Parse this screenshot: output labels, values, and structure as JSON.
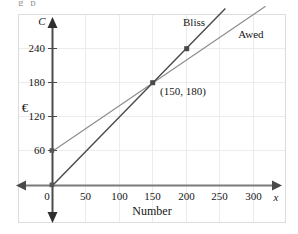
{
  "figure": {
    "clipped_top_text": "g   p",
    "frame_color": "#dcdcdc",
    "background": "#ffffff"
  },
  "chart_data": {
    "type": "line",
    "title": "",
    "subtitle": "",
    "xlabel": "Number",
    "ylabel": "€",
    "x_axis_name": "x",
    "y_axis_name": "C",
    "xlim": [
      -25,
      330
    ],
    "ylim": [
      -40,
      290
    ],
    "xticks": [
      0,
      50,
      100,
      150,
      200,
      250,
      300
    ],
    "xtick_labels": [
      "0",
      "50",
      "100",
      "150",
      "200",
      "250",
      "300"
    ],
    "yticks": [
      60,
      120,
      180,
      240
    ],
    "ytick_labels": [
      "60",
      "120",
      "180",
      "240"
    ],
    "grid": true,
    "grid_color": "#e9e9e9",
    "legend_position": "inline-labels",
    "series": [
      {
        "name": "Bliss",
        "label_x": 208,
        "label_y": 272,
        "color": "#4a4a4a",
        "intercept": 0,
        "slope": 1.2,
        "points_from": [
          0,
          0
        ],
        "points_to": [
          258,
          310
        ],
        "markers": [
          [
            0,
            0
          ],
          [
            150,
            180
          ],
          [
            200,
            240
          ]
        ]
      },
      {
        "name": "Awed",
        "label_x": 283,
        "label_y": 253,
        "color": "#8b8b8b",
        "intercept": 60,
        "slope": 0.8,
        "points_from": [
          0,
          60
        ],
        "points_to": [
          318,
          314
        ],
        "markers": [
          [
            0,
            60
          ],
          [
            150,
            180
          ]
        ]
      }
    ],
    "annotations": [
      {
        "text": "(150, 180)",
        "x": 150,
        "y": 180,
        "dx": 10,
        "dy": -18
      }
    ],
    "marker_points": [
      {
        "x": 0,
        "y": 0
      },
      {
        "x": 0,
        "y": 60
      },
      {
        "x": 150,
        "y": 180
      },
      {
        "x": 200,
        "y": 240
      }
    ]
  }
}
